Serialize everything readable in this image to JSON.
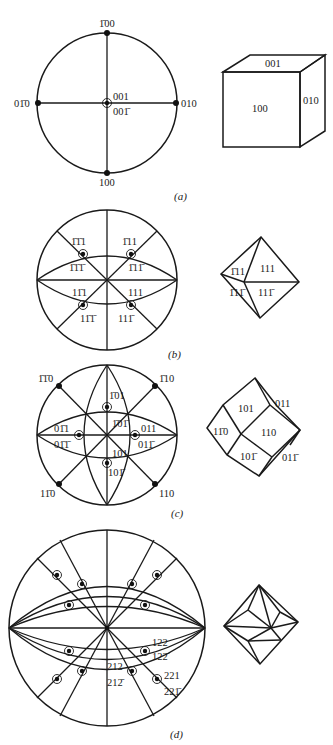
{
  "figure": {
    "panels": [
      {
        "id": "a",
        "caption": "(a)",
        "form": "cube",
        "projection": {
          "poles": [
            {
              "label": "100",
              "html": "1̄00",
              "position": "top"
            },
            {
              "label": "100",
              "position": "bottom"
            },
            {
              "label": "01̄0",
              "position": "left"
            },
            {
              "label": "010",
              "position": "right"
            },
            {
              "label": "001",
              "position": "center-upper"
            },
            {
              "label": "001̄",
              "position": "center-lower"
            }
          ]
        },
        "solid_faces": [
          {
            "label": "001",
            "face": "top"
          },
          {
            "label": "100",
            "face": "front"
          },
          {
            "label": "010",
            "face": "right"
          }
        ]
      },
      {
        "id": "b",
        "caption": "(b)",
        "form": "octahedron",
        "projection": {
          "poles": [
            {
              "label": "1̄1̄1",
              "position": "upper-left-above"
            },
            {
              "label": "1̄1̄1̄",
              "position": "upper-left-below"
            },
            {
              "label": "1̄11",
              "position": "upper-right-above"
            },
            {
              "label": "1̄11̄",
              "position": "upper-right-below"
            },
            {
              "label": "11̄1",
              "position": "lower-left-above"
            },
            {
              "label": "11̄1̄",
              "position": "lower-left-below"
            },
            {
              "label": "111",
              "position": "lower-right-above"
            },
            {
              "label": "111̄",
              "position": "lower-right-below"
            }
          ]
        },
        "solid_faces": [
          {
            "label": "1̄11",
            "face": "upper-left"
          },
          {
            "label": "111",
            "face": "upper-right"
          },
          {
            "label": "1̄11̄",
            "face": "lower-left"
          },
          {
            "label": "111̄",
            "face": "lower-right"
          }
        ]
      },
      {
        "id": "c",
        "caption": "(c)",
        "form": "rhombic dodecahedron",
        "projection": {
          "poles": [
            {
              "label": "1̄1̄0",
              "position": "upper-left"
            },
            {
              "label": "1̄10",
              "position": "upper-right"
            },
            {
              "label": "11̄0",
              "position": "lower-left"
            },
            {
              "label": "110",
              "position": "lower-right"
            },
            {
              "label": "1̄01",
              "position": "top-upper"
            },
            {
              "label": "1̄01̄",
              "position": "top-lower"
            },
            {
              "label": "01̄1",
              "position": "left-upper"
            },
            {
              "label": "01̄1̄",
              "position": "left-lower"
            },
            {
              "label": "011",
              "position": "right-upper"
            },
            {
              "label": "011̄",
              "position": "right-lower"
            },
            {
              "label": "101",
              "position": "bottom-upper"
            },
            {
              "label": "101̄",
              "position": "bottom-lower"
            }
          ]
        },
        "solid_faces": [
          {
            "label": "101",
            "face": "top"
          },
          {
            "label": "011",
            "face": "upper-right"
          },
          {
            "label": "11̄0",
            "face": "left"
          },
          {
            "label": "110",
            "face": "center"
          },
          {
            "label": "101̄",
            "face": "bottom"
          },
          {
            "label": "011̄",
            "face": "lower-right"
          }
        ]
      },
      {
        "id": "d",
        "caption": "(d)",
        "form": "trapezohedral",
        "projection": {
          "arcs_approximated": true,
          "poles": [
            {
              "label": "122",
              "position": "lower-right-1-above"
            },
            {
              "label": "122̄",
              "position": "lower-right-1-below"
            },
            {
              "label": "212",
              "position": "lower-mid-above"
            },
            {
              "label": "212̄",
              "position": "lower-mid-below"
            },
            {
              "label": "221",
              "position": "lower-right-2-above"
            },
            {
              "label": "221̄",
              "position": "lower-right-2-below"
            }
          ]
        },
        "solid_faces": []
      }
    ]
  }
}
